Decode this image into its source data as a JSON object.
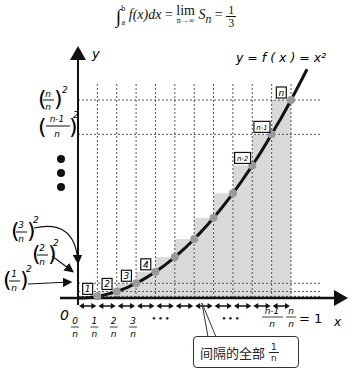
{
  "formula": {
    "integral_lower": "a",
    "integral_upper": "b",
    "integrand": "f(x)dx",
    "equals1": "=",
    "lim": "lim",
    "lim_sub": "n→∞",
    "sum": "S",
    "sum_sub": "n",
    "equals2": "=",
    "result_num": "1",
    "result_den": "3"
  },
  "axes": {
    "x_label": "x",
    "y_label": "y",
    "origin_label": "0"
  },
  "curve_label": "y = f ( x ) = x²",
  "n_intervals": 11,
  "x_tick_labels": [
    {
      "num": "0",
      "den": "n"
    },
    {
      "num": "1",
      "den": "n"
    },
    {
      "num": "2",
      "den": "n"
    },
    {
      "num": "3",
      "den": "n"
    }
  ],
  "x_tick_ellipsis": "• • •",
  "x_tick_ellipsis2": "• • •",
  "x_tick_end": [
    {
      "num": "n-1",
      "den": "n"
    },
    {
      "num": "n",
      "den": "n"
    }
  ],
  "x_tick_end_equals": "= 1",
  "y_labels": {
    "top": {
      "num": "n",
      "den": "n",
      "exp": "2"
    },
    "second": {
      "num": "n-1",
      "den": "n",
      "exp": "2"
    },
    "third": {
      "num": "3",
      "den": "n",
      "exp": "2"
    },
    "fourth": {
      "num": "2",
      "den": "n",
      "exp": "2"
    },
    "fifth": {
      "num": "1",
      "den": "n",
      "exp": "2"
    }
  },
  "box_labels": [
    "1",
    "2",
    "3",
    "4",
    "n-2",
    "n-1",
    "n"
  ],
  "callout": {
    "text": "间隔的全部",
    "frac_num": "1",
    "frac_den": "n"
  },
  "colors": {
    "shade": "#d9d9d9",
    "curve": "#111111",
    "point": "#9a9a9a",
    "grid": "#555555"
  }
}
